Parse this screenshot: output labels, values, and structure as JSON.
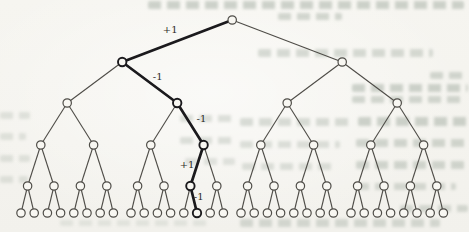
{
  "figure": {
    "type": "complete-binary-tree",
    "depth": 5,
    "num_internal_levels": 5,
    "num_leaves": 32,
    "highlighted_path": {
      "description": "bold path from root to a leaf",
      "directions": [
        "left",
        "right",
        "right",
        "left",
        "right"
      ],
      "edge_labels": [
        "+1",
        "-1",
        "-1",
        "+1",
        "-1"
      ]
    }
  },
  "colors": {
    "paper": "#f5f4ef",
    "edge": "#4e4c47",
    "node_fill": "#f8f7f2",
    "node_stroke": "#4e4c47",
    "highlight": "#1b1a1d",
    "label_text": "#2e2c28",
    "bleedthrough": "#a3ada2"
  },
  "scan_artifacts": {
    "smudges": [
      {
        "x": 148,
        "y": 1,
        "w": 316,
        "h": 8,
        "o": 0.5
      },
      {
        "x": 278,
        "y": 13,
        "w": 64,
        "h": 7,
        "o": 0.45
      },
      {
        "x": 258,
        "y": 49,
        "w": 175,
        "h": 8,
        "o": 0.4
      },
      {
        "x": 430,
        "y": 72,
        "w": 38,
        "h": 7,
        "o": 0.45
      },
      {
        "x": 352,
        "y": 84,
        "w": 116,
        "h": 8,
        "o": 0.5
      },
      {
        "x": 352,
        "y": 96,
        "w": 110,
        "h": 7,
        "o": 0.45
      },
      {
        "x": 358,
        "y": 117,
        "w": 110,
        "h": 9,
        "o": 0.5
      },
      {
        "x": 240,
        "y": 118,
        "w": 112,
        "h": 8,
        "o": 0.38
      },
      {
        "x": 356,
        "y": 139,
        "w": 112,
        "h": 8,
        "o": 0.45
      },
      {
        "x": 240,
        "y": 141,
        "w": 100,
        "h": 7,
        "o": 0.33
      },
      {
        "x": 356,
        "y": 161,
        "w": 112,
        "h": 8,
        "o": 0.45
      },
      {
        "x": 242,
        "y": 163,
        "w": 92,
        "h": 7,
        "o": 0.33
      },
      {
        "x": 356,
        "y": 183,
        "w": 100,
        "h": 7,
        "o": 0.4
      },
      {
        "x": 400,
        "y": 205,
        "w": 68,
        "h": 7,
        "o": 0.4
      },
      {
        "x": 180,
        "y": 115,
        "w": 55,
        "h": 7,
        "o": 0.33
      },
      {
        "x": 180,
        "y": 137,
        "w": 55,
        "h": 7,
        "o": 0.33
      },
      {
        "x": 185,
        "y": 158,
        "w": 50,
        "h": 7,
        "o": 0.28
      },
      {
        "x": 0,
        "y": 112,
        "w": 30,
        "h": 7,
        "o": 0.28
      },
      {
        "x": 0,
        "y": 133,
        "w": 26,
        "h": 7,
        "o": 0.28
      },
      {
        "x": 0,
        "y": 155,
        "w": 30,
        "h": 7,
        "o": 0.28
      },
      {
        "x": 0,
        "y": 176,
        "w": 28,
        "h": 7,
        "o": 0.28
      },
      {
        "x": 240,
        "y": 219,
        "w": 200,
        "h": 8,
        "o": 0.4
      },
      {
        "x": 60,
        "y": 220,
        "w": 150,
        "h": 6,
        "o": 0.22
      }
    ]
  }
}
